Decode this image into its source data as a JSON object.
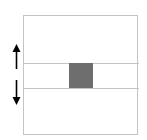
{
  "diagram": {
    "frame": {
      "stroke": "#c4c4c4"
    },
    "band": {
      "top_line_y": 63,
      "bottom_line_y": 88
    },
    "block": {
      "color": "#6e6e6e"
    },
    "arrows": [
      {
        "direction": "up",
        "icon": "arrow-up-icon"
      },
      {
        "direction": "down",
        "icon": "arrow-down-icon"
      }
    ]
  }
}
